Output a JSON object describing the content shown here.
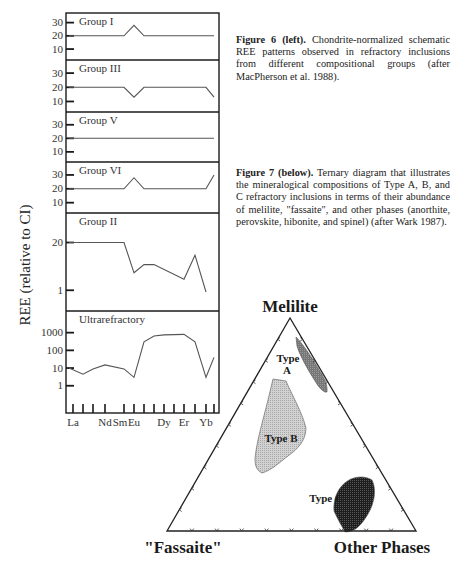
{
  "figure6": {
    "caption_label": "Figure 6 (left).",
    "caption_text": " Chondrite-normalized schematic REE patterns observed in refractory inclusions from different compositional groups (after MacPherson et al. 1988).",
    "ylabel": "REE  (relative to CI)",
    "elements": [
      "La",
      "Ce",
      "Pr",
      "Nd",
      "Sm",
      "Eu",
      "Gd",
      "Tb",
      "Dy",
      "Ho",
      "Er",
      "Tm",
      "Yb",
      "Lu"
    ],
    "xtick_labels": [
      {
        "element": "La",
        "label": "La"
      },
      {
        "element": "Nd",
        "label": "Nd"
      },
      {
        "element": "Sm",
        "label": "Sm"
      },
      {
        "element": "Eu",
        "label": "Eu"
      },
      {
        "element": "Dy",
        "label": "Dy"
      },
      {
        "element": "Er",
        "label": "Er"
      },
      {
        "element": "Yb",
        "label": "Yb"
      }
    ]
  },
  "figure7": {
    "caption_label": "Figure 7 (below).",
    "caption_text": " Ternary diagram that illustrates the mineralogical compositions of Type A, B, and C refractory inclusions in terms of their abundance of melilite, \"fassaite\", and other phases (anorthite, perovskite, hibonite, and spinel) (after Wark 1987).",
    "apex_top": "Melilite",
    "apex_left": "\"Fassaite\"",
    "apex_right": "Other Phases",
    "fields": [
      {
        "name": "Type A",
        "label_lines": [
          "Type",
          "A"
        ],
        "fill": "#7a7a7a"
      },
      {
        "name": "Type B",
        "label_lines": [
          "Type B"
        ],
        "fill": "#c9c9c9"
      },
      {
        "name": "Type C",
        "label_lines": [
          "Type C"
        ],
        "fill": "#2b2b2b"
      }
    ]
  },
  "chart_data": [
    {
      "type": "line",
      "title": "Chondrite-normalized schematic REE patterns",
      "xlabel": "",
      "ylabel": "REE  (relative to CI)",
      "x": [
        "La",
        "Ce",
        "Pr",
        "Nd",
        "Sm",
        "Eu",
        "Gd",
        "Tb",
        "Dy",
        "Ho",
        "Er",
        "Tm",
        "Yb",
        "Lu"
      ],
      "panels": [
        {
          "name": "Group I",
          "scale": "linear",
          "yticks": [
            10,
            20,
            30
          ],
          "ylim": [
            4,
            35
          ],
          "x": [
            "La",
            "Sm",
            "Eu",
            "Gd",
            "Lu"
          ],
          "values": [
            20,
            20,
            28,
            20,
            20
          ]
        },
        {
          "name": "Group III",
          "scale": "linear",
          "yticks": [
            10,
            20,
            30
          ],
          "ylim": [
            4,
            35
          ],
          "x": [
            "La",
            "Sm",
            "Eu",
            "Gd",
            "Yb",
            "Lu"
          ],
          "values": [
            20,
            20,
            13,
            20,
            20,
            13
          ]
        },
        {
          "name": "Group V",
          "scale": "linear",
          "yticks": [
            10,
            20,
            30
          ],
          "ylim": [
            4,
            35
          ],
          "x": [
            "La",
            "Lu"
          ],
          "values": [
            20,
            20
          ]
        },
        {
          "name": "Group VI",
          "scale": "linear",
          "yticks": [
            10,
            20,
            30
          ],
          "ylim": [
            4,
            35
          ],
          "x": [
            "La",
            "Sm",
            "Eu",
            "Gd",
            "Yb",
            "Lu"
          ],
          "values": [
            20,
            20,
            28,
            20,
            20,
            30
          ]
        },
        {
          "name": "Group II",
          "scale": "log",
          "yticks": [
            1,
            20
          ],
          "ylim": [
            0.45,
            60
          ],
          "x": [
            "La",
            "Nd",
            "Sm",
            "Eu",
            "Gd",
            "Tb",
            "Er",
            "Tm",
            "Yb"
          ],
          "values": [
            20,
            20,
            20,
            3,
            5,
            5,
            2,
            9,
            0.9
          ]
        },
        {
          "name": "Ultrarefractory",
          "scale": "log",
          "yticks": [
            1,
            10,
            100,
            1000
          ],
          "ylim": [
            0.3,
            4000
          ],
          "x": [
            "La",
            "Ce",
            "Pr",
            "Nd",
            "Sm",
            "Eu",
            "Gd",
            "Tb",
            "Dy",
            "Er",
            "Tm",
            "Yb",
            "Lu"
          ],
          "values": [
            10,
            4.5,
            9,
            15,
            9,
            3,
            300,
            650,
            750,
            800,
            300,
            3,
            40
          ]
        }
      ]
    },
    {
      "type": "ternary",
      "title": "Mineralogical compositions of Type A, B and C refractory inclusions",
      "axes": [
        "Melilite",
        "\"Fassaite\"",
        "Other Phases"
      ],
      "ticks_per_side": 9,
      "regions": [
        {
          "name": "Type A",
          "approx_center": {
            "Melilite": 0.72,
            "Fassaite": 0.0,
            "Other Phases": 0.28
          }
        },
        {
          "name": "Type B",
          "approx_center": {
            "Melilite": 0.45,
            "Fassaite": 0.4,
            "Other Phases": 0.15
          }
        },
        {
          "name": "Type C",
          "approx_center": {
            "Melilite": 0.1,
            "Fassaite": 0.3,
            "Other Phases": 0.6
          }
        }
      ]
    }
  ]
}
